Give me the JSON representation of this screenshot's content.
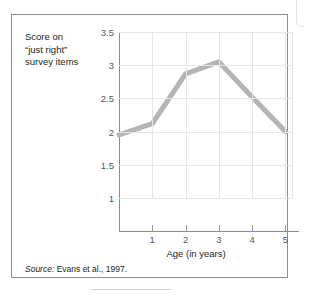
{
  "figure": {
    "y_caption": "Score on\n“just right”\nsurvey items",
    "source_keyword": "Source:",
    "source_text": " Evans et al., 1997."
  },
  "chart_data": {
    "type": "line",
    "title": "",
    "xlabel": "Age (in years)",
    "ylabel": "Score on “just right” survey items",
    "x": [
      0,
      1,
      2,
      3,
      4,
      5
    ],
    "xtick_labels": [
      "1",
      "2",
      "3",
      "4",
      "5"
    ],
    "xticks": [
      1,
      2,
      3,
      4,
      5
    ],
    "ytick_labels": [
      "3.5",
      "3",
      "2.5",
      "2",
      "1.5",
      "1"
    ],
    "yticks": [
      3.5,
      3,
      2.5,
      2,
      1.5,
      1
    ],
    "xlim": [
      0,
      5.2
    ],
    "ylim": [
      1,
      3.5
    ],
    "grid": true,
    "legend": false,
    "series": [
      {
        "name": "Score on “just right” survey items",
        "values": [
          1.95,
          2.12,
          2.87,
          3.05,
          2.52,
          2.0
        ],
        "color": "#b4b4b4",
        "line_width": 5
      }
    ]
  }
}
